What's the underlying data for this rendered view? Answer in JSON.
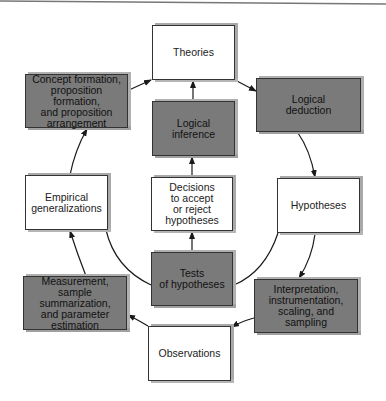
{
  "diagram": {
    "type": "research-cycle",
    "nodes": [
      {
        "id": "theories",
        "label": "Theories",
        "style": "light",
        "x": 152,
        "y": 25,
        "w": 83,
        "h": 55
      },
      {
        "id": "concept_formation",
        "label": "Concept formation,\nproposition formation,\nand proposition\narrangement",
        "style": "dark",
        "x": 25,
        "y": 74,
        "w": 103,
        "h": 54
      },
      {
        "id": "logical_deduction",
        "label": "Logical\ndeduction",
        "style": "dark",
        "x": 256,
        "y": 78,
        "w": 105,
        "h": 54
      },
      {
        "id": "logical_inference",
        "label": "Logical\ninference",
        "style": "dark",
        "x": 152,
        "y": 101,
        "w": 83,
        "h": 55
      },
      {
        "id": "empirical_generalizations",
        "label": "Empirical\ngeneralizations",
        "style": "light",
        "x": 25,
        "y": 175,
        "w": 83,
        "h": 55
      },
      {
        "id": "decisions",
        "label": "Decisions\nto accept\nor reject\nhypotheses",
        "style": "light",
        "x": 151,
        "y": 177,
        "w": 82,
        "h": 54
      },
      {
        "id": "hypotheses",
        "label": "Hypotheses",
        "style": "light",
        "x": 277,
        "y": 178,
        "w": 83,
        "h": 55
      },
      {
        "id": "tests_of_hypotheses",
        "label": "Tests\nof hypotheses",
        "style": "dark",
        "x": 151,
        "y": 252,
        "w": 82,
        "h": 54
      },
      {
        "id": "measurement",
        "label": "Measurement,\nsample summarization,\nand parameter\nestimation",
        "style": "dark",
        "x": 23,
        "y": 276,
        "w": 104,
        "h": 54
      },
      {
        "id": "interpretation",
        "label": "Interpretation,\ninstrumentation,\nscaling, and\nsampling",
        "style": "dark",
        "x": 254,
        "y": 279,
        "w": 104,
        "h": 54
      },
      {
        "id": "observations",
        "label": "Observations",
        "style": "light",
        "x": 148,
        "y": 326,
        "w": 83,
        "h": 55
      }
    ],
    "edges": [
      {
        "from": "concept_formation",
        "to": "theories"
      },
      {
        "from": "theories",
        "to": "logical_deduction"
      },
      {
        "from": "logical_deduction",
        "to": "hypotheses"
      },
      {
        "from": "hypotheses",
        "to": "interpretation"
      },
      {
        "from": "interpretation",
        "to": "observations"
      },
      {
        "from": "observations",
        "to": "measurement"
      },
      {
        "from": "measurement",
        "to": "empirical_generalizations"
      },
      {
        "from": "empirical_generalizations",
        "to": "concept_formation"
      },
      {
        "from": "logical_inference",
        "to": "theories"
      },
      {
        "from": "decisions",
        "to": "logical_inference"
      },
      {
        "from": "tests_of_hypotheses",
        "to": "decisions"
      },
      {
        "from": "hypotheses",
        "to": "tests_of_hypotheses",
        "curve": true
      },
      {
        "from": "tests_of_hypotheses",
        "to": "empirical_generalizations",
        "curve": true
      }
    ]
  },
  "colors": {
    "light_box": "#ffffff",
    "dark_box": "#7a7a7a",
    "border": "#333333",
    "shadow": "#a9a9a9",
    "line": "#1a1a1a"
  }
}
